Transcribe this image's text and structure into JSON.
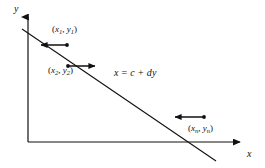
{
  "figure": {
    "type": "line-fit-diagram",
    "stroke_color": "#111111",
    "background_color": "#ffffff"
  },
  "axes": {
    "y_axis": {
      "label": "y",
      "icon": "arrow-up-icon",
      "x": 28,
      "y_top": 12,
      "y_bottom": 142
    },
    "x_axis": {
      "label": "x",
      "icon": "arrow-right-icon",
      "y": 142,
      "x_left": 28,
      "x_right": 245
    }
  },
  "fit_line": {
    "equation": "x = c + dy",
    "equation_parts": {
      "lhs": "x",
      "equals": "=",
      "intercept": "c",
      "plus": "+",
      "slope": "d",
      "variable": "y"
    },
    "x1": 22,
    "y1": 29,
    "x2": 216,
    "y2": 161
  },
  "points": [
    {
      "label_x": "x",
      "label_x_sub": "1",
      "label_y": "y",
      "label_y_sub": "1",
      "label": "(x1, y1)",
      "dot_x": 67,
      "dot_y": 45,
      "arrow_to_x": 38,
      "arrow_to_y": 45,
      "direction": "left"
    },
    {
      "label_x": "x",
      "label_x_sub": "2",
      "label_y": "y",
      "label_y_sub": "2",
      "label": "(x2, y2)",
      "dot_x": 68,
      "dot_y": 66,
      "arrow_to_x": 98,
      "arrow_to_y": 66,
      "direction": "right"
    },
    {
      "label_x": "x",
      "label_x_sub": "n",
      "label_y": "y",
      "label_y_sub": "n",
      "label": "(xn, yn)",
      "dot_x": 204,
      "dot_y": 117,
      "arrow_to_x": 172,
      "arrow_to_y": 117,
      "direction": "left"
    }
  ]
}
